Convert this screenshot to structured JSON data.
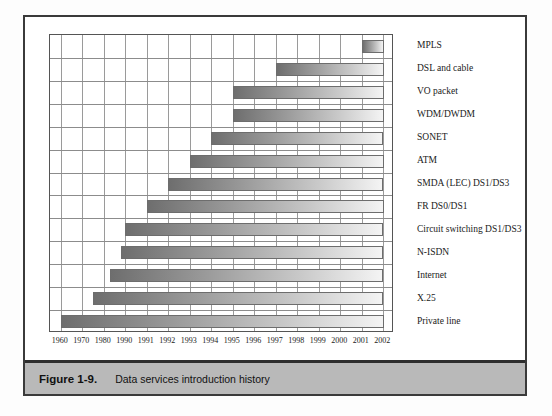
{
  "figure": {
    "number_label": "Figure 1-9.",
    "caption": "Data services introduction history"
  },
  "chart_data": {
    "type": "bar",
    "orientation": "horizontal",
    "subtype": "gantt-timeline",
    "title": "Data services introduction history",
    "xlabel": "",
    "ylabel": "",
    "xlim": [
      1960,
      2002
    ],
    "grid": true,
    "legend": null,
    "bar_gradient": [
      "#6e6e6e",
      "#f4f4f4"
    ],
    "tick_labels": [
      "1960",
      "1970",
      "1980",
      "1990",
      "1991",
      "1992",
      "1993",
      "1994",
      "1995",
      "1996",
      "1997",
      "1998",
      "1999",
      "2000",
      "2001",
      "2002"
    ],
    "tick_values": [
      1960,
      1970,
      1980,
      1990,
      1991,
      1992,
      1993,
      1994,
      1995,
      1996,
      1997,
      1998,
      1999,
      2000,
      2001,
      2002
    ],
    "categories": [
      "MPLS",
      "DSL and cable",
      "VO packet",
      "WDM/DWDM",
      "SONET",
      "ATM",
      "SMDA (LEC) DS1/DS3",
      "FR DS0/DS1",
      "Circuit switching DS1/DS3",
      "N-ISDN",
      "Internet",
      "X.25",
      "Private line"
    ],
    "bars": [
      {
        "label": "MPLS",
        "start": 2001,
        "end": 2002
      },
      {
        "label": "DSL and cable",
        "start": 1997,
        "end": 2002
      },
      {
        "label": "VO packet",
        "start": 1995,
        "end": 2002
      },
      {
        "label": "WDM/DWDM",
        "start": 1995,
        "end": 2002
      },
      {
        "label": "SONET",
        "start": 1994,
        "end": 2002
      },
      {
        "label": "ATM",
        "start": 1993,
        "end": 2002
      },
      {
        "label": "SMDA (LEC) DS1/DS3",
        "start": 1992,
        "end": 2002
      },
      {
        "label": "FR DS0/DS1",
        "start": 1991,
        "end": 2002
      },
      {
        "label": "Circuit switching DS1/DS3",
        "start": 1990,
        "end": 2002
      },
      {
        "label": "N-ISDN",
        "start": 1988,
        "end": 2002
      },
      {
        "label": "Internet",
        "start": 1983,
        "end": 2002
      },
      {
        "label": "X.25",
        "start": 1975,
        "end": 2002
      },
      {
        "label": "Private line",
        "start": 1960,
        "end": 2002
      }
    ]
  }
}
